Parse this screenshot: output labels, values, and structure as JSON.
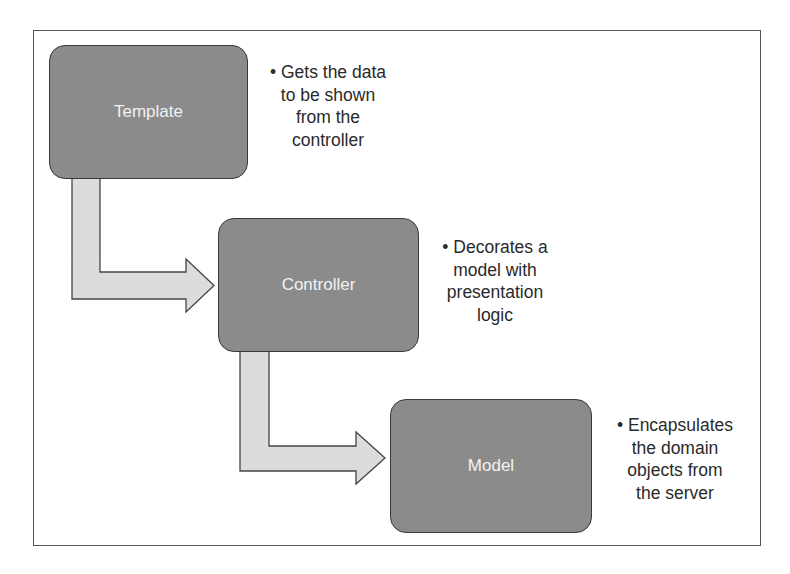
{
  "diagram": {
    "colors": {
      "box_fill": "#8b8b8b",
      "box_border": "#3a3a3a",
      "box_text": "#f2f2f2",
      "arrow_fill": "#dcdcdc",
      "arrow_border": "#444444",
      "note_text": "#2a2a2a",
      "frame_border": "#555555"
    },
    "nodes": [
      {
        "id": "template",
        "label": "Template",
        "note_lines": [
          "• Gets the data",
          "to be shown",
          "from the",
          "controller"
        ]
      },
      {
        "id": "controller",
        "label": "Controller",
        "note_lines": [
          "• Decorates a",
          "model with",
          "presentation",
          "logic"
        ]
      },
      {
        "id": "model",
        "label": "Model",
        "note_lines": [
          "• Encapsulates",
          "the domain",
          "objects from",
          "the server"
        ]
      }
    ],
    "edges": [
      {
        "from": "template",
        "to": "controller",
        "type": "elbow-arrow"
      },
      {
        "from": "controller",
        "to": "model",
        "type": "elbow-arrow"
      }
    ]
  }
}
